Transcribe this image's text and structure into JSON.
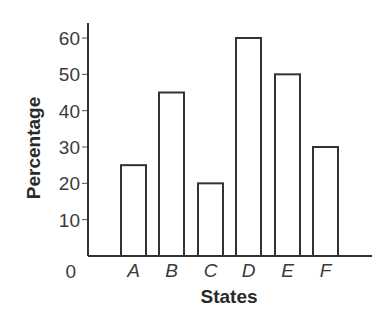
{
  "chart_data": {
    "type": "bar",
    "title": "",
    "xlabel": "States",
    "ylabel": "Percentage",
    "categories": [
      "A",
      "B",
      "C",
      "D",
      "E",
      "F"
    ],
    "values": [
      25,
      45,
      20,
      60,
      50,
      30
    ],
    "yticks": [
      "0",
      "10",
      "20",
      "30",
      "40",
      "50",
      "60"
    ],
    "ylim": [
      0,
      60
    ],
    "grid": false,
    "legend": null,
    "bar_fill": "#ffffff",
    "bar_stroke": "#333333"
  }
}
